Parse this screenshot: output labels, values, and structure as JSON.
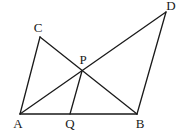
{
  "diagram": {
    "type": "geometry",
    "points": {
      "A": {
        "label": "A",
        "x": 20,
        "y": 114,
        "lx": 18,
        "ly": 128
      },
      "Q": {
        "label": "Q",
        "x": 70,
        "y": 114,
        "lx": 70,
        "ly": 128
      },
      "B": {
        "label": "B",
        "x": 137,
        "y": 114,
        "lx": 140,
        "ly": 128
      },
      "C": {
        "label": "C",
        "x": 40,
        "y": 37,
        "lx": 38,
        "ly": 32
      },
      "D": {
        "label": "D",
        "x": 166,
        "y": 12,
        "lx": 171,
        "ly": 10
      },
      "P": {
        "label": "P",
        "x": 82,
        "y": 71,
        "lx": 83,
        "ly": 64
      }
    },
    "segments": [
      [
        "A",
        "C"
      ],
      [
        "C",
        "B"
      ],
      [
        "A",
        "D"
      ],
      [
        "D",
        "B"
      ],
      [
        "A",
        "B"
      ],
      [
        "P",
        "Q"
      ]
    ],
    "line_color": "#1a1a1a"
  }
}
